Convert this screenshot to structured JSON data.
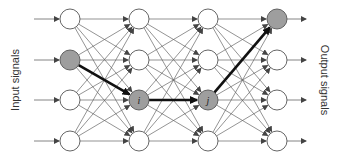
{
  "labels": {
    "input": "Input signals",
    "output": "Output signals",
    "node_i": "i",
    "node_j": "j"
  },
  "network": {
    "layers": 4,
    "nodes_per_layer": 4,
    "layer_x": [
      70,
      139,
      208,
      277
    ],
    "row_y": [
      19,
      60,
      100,
      141
    ],
    "node_radius": 10,
    "highlighted_nodes": [
      [
        0,
        1
      ],
      [
        1,
        2
      ],
      [
        2,
        2
      ],
      [
        3,
        0
      ]
    ],
    "highlighted_path": [
      [
        0,
        1
      ],
      [
        1,
        2
      ],
      [
        2,
        2
      ],
      [
        3,
        0
      ]
    ],
    "node_labels": {
      "1,2": "i",
      "2,2": "j"
    }
  },
  "colors": {
    "node_fill": "#ffffff",
    "node_highlight_fill": "#9e9e9e",
    "node_stroke": "#555555",
    "edge": "#666666",
    "path": "#111111"
  }
}
